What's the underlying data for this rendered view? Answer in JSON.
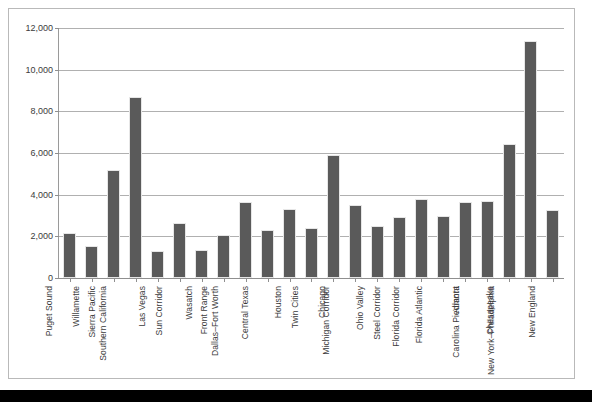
{
  "chart_data": {
    "type": "bar",
    "title": "",
    "subtitle": "",
    "xlabel": "",
    "ylabel": "",
    "ylim": [
      0,
      12000
    ],
    "ytick_values": [
      0,
      2000,
      4000,
      6000,
      8000,
      10000,
      12000
    ],
    "ytick_labels": [
      "0",
      "2,000",
      "4,000",
      "6,000",
      "8,000",
      "10,000",
      "12,000"
    ],
    "grid": "horizontal",
    "legend": "none",
    "bar_color": "#5a5a5a",
    "categories": [
      "Puget Sound",
      "Willamette",
      "Sierra Pacific",
      "Southern California",
      "Las Vegas",
      "Sun Corridor",
      "Wasatch",
      "Front Range",
      "Dallas–Fort Worth",
      "Central Texas",
      "Houston",
      "Twin Cities",
      "Chicago",
      "Michigan Corridor",
      "Ohio Valley",
      "Steel Corridor",
      "Florida Corridor",
      "Florida Atlantic",
      "Atlanta",
      "Carolina Piedmont",
      "Chesapeake",
      "New York–Philadelphia",
      "New England"
    ],
    "values": [
      2050,
      1420,
      5090,
      8590,
      1180,
      2550,
      1230,
      1980,
      3570,
      2200,
      3240,
      2290,
      5800,
      3400,
      2420,
      2830,
      3720,
      2880,
      3540,
      3620,
      6340,
      11300,
      3170
    ]
  }
}
